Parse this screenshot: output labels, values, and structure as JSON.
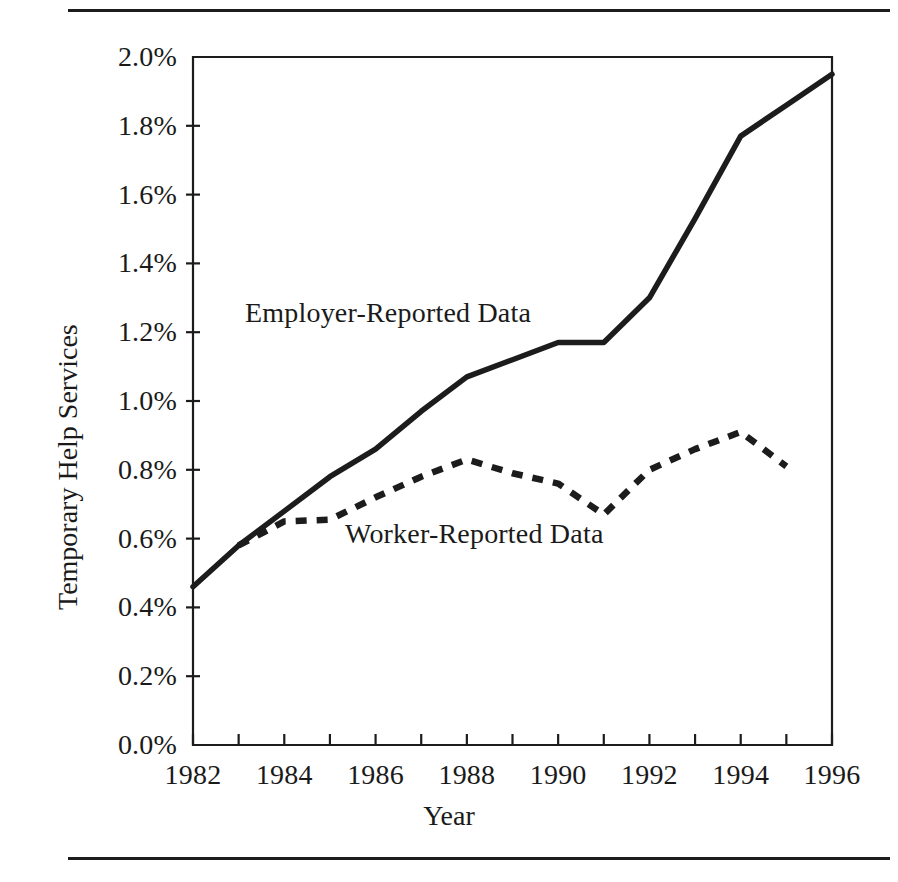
{
  "figure": {
    "top_rule": "horizontal-rule",
    "bottom_rule": "horizontal-rule"
  },
  "chart_data": {
    "type": "line",
    "title": "",
    "xlabel": "Year",
    "ylabel": "Temporary Help Services",
    "xlim": [
      1982,
      1996
    ],
    "ylim": [
      0.0,
      2.0
    ],
    "grid": false,
    "legend_position": "inline-annotations",
    "y_tick_labels": [
      "2.0%",
      "1.8%",
      "1.6%",
      "1.4%",
      "1.2%",
      "1.0%",
      "0.8%",
      "0.6%",
      "0.4%",
      "0.2%",
      "0.0%"
    ],
    "y_tick_values": [
      2.0,
      1.8,
      1.6,
      1.4,
      1.2,
      1.0,
      0.8,
      0.6,
      0.4,
      0.2,
      0.0
    ],
    "x_tick_labels": [
      "1982",
      "1984",
      "1986",
      "1988",
      "1990",
      "1992",
      "1994",
      "1996"
    ],
    "x_tick_values": [
      1982,
      1984,
      1986,
      1988,
      1990,
      1992,
      1994,
      1996
    ],
    "x_minor_ticks": [
      1983,
      1985,
      1987,
      1989,
      1991,
      1993,
      1995
    ],
    "y_unit": "percent",
    "series": [
      {
        "name": "Employer-Reported Data",
        "style": "solid",
        "color": "#1c1c1c",
        "x": [
          1982,
          1983,
          1984,
          1985,
          1986,
          1987,
          1988,
          1989,
          1990,
          1991,
          1992,
          1993,
          1994,
          1995,
          1996
        ],
        "values": [
          0.46,
          0.58,
          0.68,
          0.78,
          0.86,
          0.97,
          1.07,
          1.12,
          1.17,
          1.17,
          1.3,
          1.53,
          1.77,
          1.86,
          1.95
        ]
      },
      {
        "name": "Worker-Reported Data",
        "style": "dashed",
        "color": "#1c1c1c",
        "x": [
          1983,
          1984,
          1985,
          1986,
          1987,
          1988,
          1989,
          1990,
          1991,
          1992,
          1993,
          1994,
          1995
        ],
        "values": [
          0.58,
          0.65,
          0.655,
          0.72,
          0.78,
          0.83,
          0.79,
          0.76,
          0.67,
          0.8,
          0.86,
          0.91,
          0.81
        ]
      }
    ],
    "annotations": [
      {
        "text": "Employer-Reported Data",
        "series": "Employer-Reported Data"
      },
      {
        "text": "Worker-Reported Data",
        "series": "Worker-Reported Data"
      }
    ]
  }
}
